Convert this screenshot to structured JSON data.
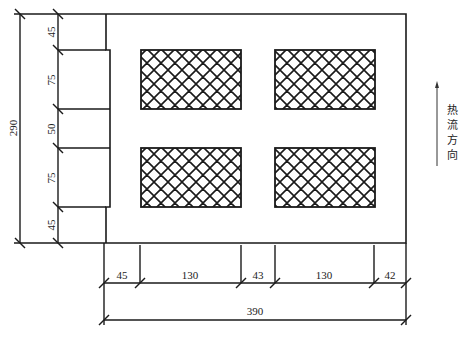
{
  "diagram": {
    "type": "engineering-drawing",
    "colors": {
      "line": "#1a1a1a",
      "background": "#ffffff",
      "hatch": "#1a1a1a"
    },
    "units": "mm",
    "vertical_dimensions": {
      "total": "290",
      "segments": [
        "45",
        "75",
        "50",
        "75",
        "45"
      ]
    },
    "horizontal_dimensions": {
      "total": "390",
      "segments": [
        "45",
        "130",
        "43",
        "130",
        "42"
      ]
    },
    "hatched_regions": [
      {
        "id": "top-left",
        "label": ""
      },
      {
        "id": "top-right",
        "label": ""
      },
      {
        "id": "bottom-left",
        "label": ""
      },
      {
        "id": "bottom-right",
        "label": ""
      }
    ],
    "heat_flow": {
      "label": "热流方向",
      "chars": [
        "热",
        "流",
        "方",
        "向"
      ],
      "direction": "up"
    }
  }
}
